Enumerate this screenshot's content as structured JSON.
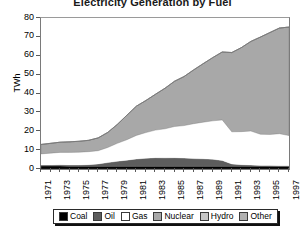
{
  "chart_data": {
    "type": "area",
    "stacked": true,
    "title": "Electricity Generation by Fuel",
    "xlabel": "",
    "ylabel": "TWh",
    "ylim": [
      0,
      80
    ],
    "ytick_step": 10,
    "yticks": [
      "80",
      "70",
      "60",
      "50",
      "40",
      "30",
      "20",
      "10",
      "0"
    ],
    "grid": false,
    "legend_position": "bottom",
    "x": [
      1971,
      1972,
      1973,
      1974,
      1975,
      1976,
      1977,
      1978,
      1979,
      1980,
      1981,
      1982,
      1983,
      1984,
      1985,
      1986,
      1987,
      1988,
      1989,
      1990,
      1991,
      1992,
      1993,
      1994,
      1995,
      1996,
      1997
    ],
    "xtick_labels": [
      "1971",
      "1973",
      "1975",
      "1977",
      "1979",
      "1981",
      "1983",
      "1985",
      "1987",
      "1989",
      "1991",
      "1993",
      "1995",
      "1997"
    ],
    "series": [
      {
        "name": "Coal",
        "color": "#000000",
        "values": [
          1.6,
          1.6,
          1.6,
          1.5,
          1.5,
          1.5,
          1.5,
          1.5,
          1.5,
          1.5,
          1.5,
          1.5,
          1.5,
          1.5,
          1.5,
          1.5,
          1.5,
          1.5,
          1.5,
          1.5,
          1.5,
          1.5,
          1.5,
          1.5,
          1.5,
          1.5,
          1.5
        ]
      },
      {
        "name": "Oil",
        "color": "#5d5d5d",
        "values": [
          0.5,
          0.5,
          0.6,
          0.6,
          0.6,
          0.8,
          1.2,
          1.9,
          2.6,
          3.2,
          3.8,
          4.2,
          4.5,
          4.4,
          4.5,
          4.3,
          4.0,
          3.9,
          3.7,
          3.0,
          1.2,
          0.8,
          0.6,
          0.4,
          0.3,
          0.2,
          0.2
        ]
      },
      {
        "name": "Gas",
        "color": "#ffffff",
        "values": [
          5.9,
          6.3,
          6.6,
          6.7,
          6.8,
          6.9,
          7.0,
          8.0,
          9.5,
          10.8,
          12.5,
          13.6,
          14.6,
          15.4,
          16.5,
          17.2,
          18.5,
          19.4,
          20.3,
          21.5,
          17.0,
          17.5,
          18.0,
          16.5,
          16.5,
          17.0,
          16.0
        ]
      },
      {
        "name": "Nuclear",
        "color": "#a8a8a8",
        "values": [
          5.0,
          5.2,
          5.4,
          5.6,
          5.8,
          6.0,
          6.8,
          8.0,
          10.0,
          13.0,
          15.5,
          17.0,
          19.0,
          21.5,
          24.0,
          26.0,
          28.5,
          31.0,
          33.5,
          36.0,
          42.0,
          44.5,
          47.5,
          51.5,
          54.0,
          56.0,
          57.5
        ]
      },
      {
        "name": "Hydro",
        "color": "#c6c6c6",
        "values": [
          0,
          0,
          0,
          0,
          0,
          0,
          0,
          0,
          0,
          0,
          0,
          0,
          0,
          0,
          0,
          0,
          0,
          0,
          0,
          0,
          0,
          0,
          0,
          0,
          0,
          0,
          0
        ]
      },
      {
        "name": "Other",
        "color": "#b0b0b0",
        "values": [
          0,
          0,
          0,
          0,
          0,
          0,
          0,
          0,
          0,
          0,
          0,
          0,
          0,
          0,
          0,
          0,
          0,
          0,
          0,
          0,
          0,
          0,
          0,
          0,
          0,
          0,
          0
        ]
      }
    ],
    "totals": [
      13.0,
      13.6,
      14.2,
      14.4,
      14.7,
      15.2,
      16.5,
      19.4,
      23.6,
      28.5,
      33.3,
      36.3,
      39.6,
      42.8,
      46.5,
      49.0,
      52.5,
      55.8,
      59.0,
      62.0,
      61.7,
      64.3,
      67.6,
      69.9,
      72.3,
      74.7,
      75.2
    ]
  },
  "legend": {
    "items": [
      {
        "label": "Coal",
        "color": "#000000"
      },
      {
        "label": "Oil",
        "color": "#5d5d5d"
      },
      {
        "label": "Gas",
        "color": "#ffffff"
      },
      {
        "label": "Nuclear",
        "color": "#a8a8a8"
      },
      {
        "label": "Hydro",
        "color": "#c6c6c6"
      },
      {
        "label": "Other",
        "color": "#b0b0b0"
      }
    ]
  }
}
